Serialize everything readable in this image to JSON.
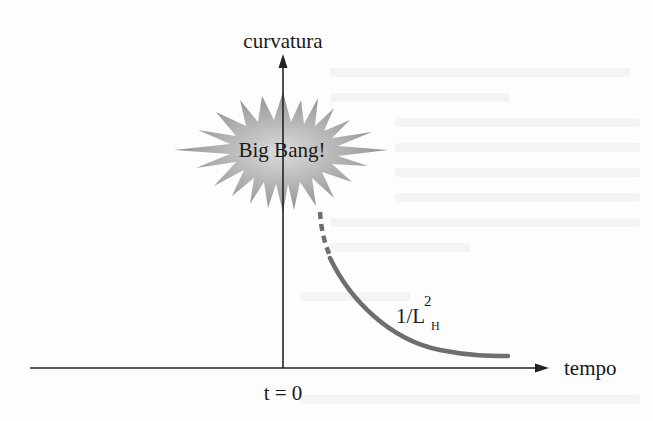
{
  "diagram": {
    "y_axis_label": "curvatura",
    "x_axis_label": "tempo",
    "origin_label": "t = 0",
    "burst_label": "Big Bang!",
    "curve_label": {
      "base": "1/L",
      "superscript": "2",
      "subscript": "H"
    },
    "colors": {
      "axis": "#222222",
      "curve": "#6e6e6e",
      "burst_center": "#d9d9d9",
      "burst_edge": "#8c8c8c",
      "text": "#1a1a1a"
    }
  }
}
